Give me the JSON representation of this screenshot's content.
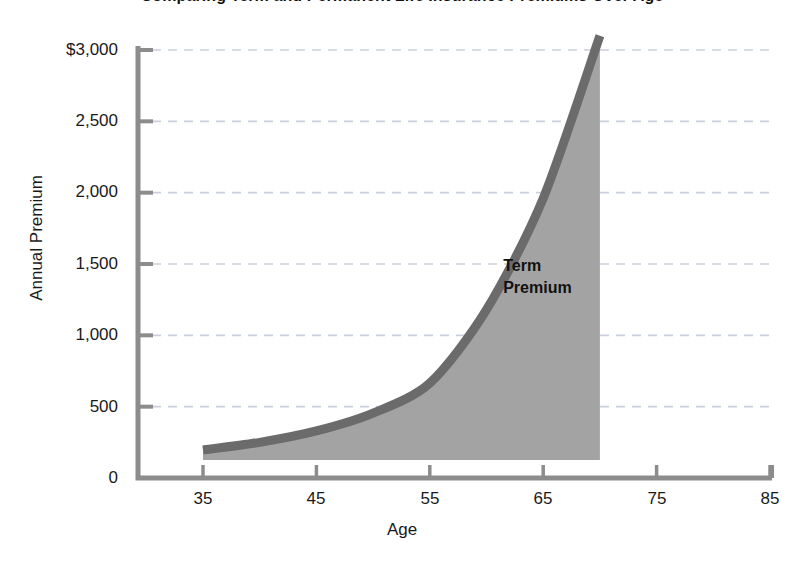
{
  "chart_data": {
    "type": "area",
    "title": "Comparing Term and Permanent Life Insurance Premiums Over Age",
    "xlabel": "Age",
    "ylabel": "Annual Premium",
    "xlim": [
      30,
      85
    ],
    "ylim": [
      0,
      3000
    ],
    "xticks": [
      35,
      45,
      55,
      65,
      75,
      85
    ],
    "xtick_labels": [
      "35",
      "45",
      "55",
      "65",
      "75",
      "85"
    ],
    "yticks": [
      0,
      500,
      1000,
      1500,
      2000,
      2500,
      3000
    ],
    "ytick_labels": [
      "0",
      "500",
      "1,000",
      "1,500",
      "2,000",
      "2,500",
      "3,000"
    ],
    "ytick_label_top": "$3,000",
    "grid": "horizontal-dashed",
    "legend": "none",
    "annotations": [
      {
        "name": "term-premium-label",
        "text_line_1": "Term",
        "text_line_2": "Premium",
        "x": 62,
        "y": 1450
      }
    ],
    "series": [
      {
        "name": "Term Premium",
        "fill_color": "#a3a3a3",
        "line_color": "#6b6b6b",
        "x": [
          35,
          40,
          45,
          50,
          55,
          60,
          65,
          70
        ],
        "values": [
          196,
          250,
          330,
          455,
          665,
          1180,
          1960,
          3100
        ]
      }
    ]
  },
  "colors": {
    "axis": "#8c8c8c",
    "grid": "#c9cfdc",
    "area_fill": "#a3a3a3",
    "area_border": "#6b6b6b",
    "text": "#1a1a1a",
    "background": "#ffffff"
  }
}
